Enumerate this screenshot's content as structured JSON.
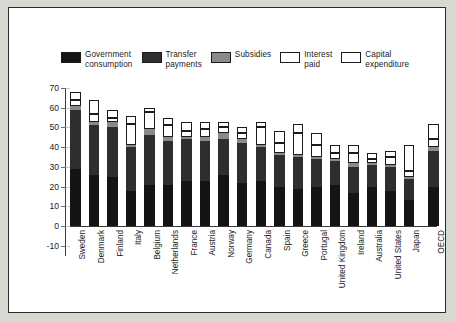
{
  "chart_data": {
    "type": "bar",
    "stacked": true,
    "title": "",
    "xlabel": "",
    "ylabel": "",
    "ylim": [
      -10,
      70
    ],
    "yticks": [
      -10,
      0,
      10,
      20,
      30,
      40,
      50,
      60,
      70
    ],
    "grid": false,
    "legend_position": "top",
    "categories": [
      "Sweden",
      "Denmark",
      "Finland",
      "Italy",
      "Belgium",
      "Netherlands",
      "France",
      "Austria",
      "Norway",
      "Germany",
      "Canada",
      "Spain",
      "Greece",
      "Portugal",
      "United Kingdom",
      "Ireland",
      "Australia",
      "United States",
      "Japan",
      "OECD"
    ],
    "series": [
      {
        "name": "Government consumption",
        "color": "#141414",
        "values": [
          29,
          26,
          25,
          18,
          21,
          21,
          23,
          23,
          26,
          22,
          23,
          20,
          19,
          20,
          21,
          17,
          20,
          18,
          13,
          20
        ]
      },
      {
        "name": "Transfer payments",
        "color": "#2e2e2e",
        "values": [
          30,
          25,
          25,
          22,
          25,
          22,
          21,
          20,
          18,
          20,
          17,
          16,
          16,
          14,
          12,
          13,
          11,
          12,
          11,
          18
        ]
      },
      {
        "name": "Subsidies",
        "color": "#8a8a8a",
        "values": [
          2,
          2,
          3,
          1,
          3,
          2,
          1,
          2,
          3,
          2,
          1,
          1,
          1,
          1,
          1,
          2,
          1,
          1,
          1,
          2
        ]
      },
      {
        "name": "Interest paid",
        "color": "#ffffff",
        "values": [
          3,
          4,
          2,
          11,
          9,
          6,
          3,
          4,
          3,
          3,
          9,
          5,
          11,
          6,
          3,
          5,
          2,
          4,
          3,
          4
        ]
      },
      {
        "name": "Capital expenditure",
        "color": "#ffffff",
        "values": [
          4,
          7,
          4,
          4,
          2,
          4,
          5,
          4,
          3,
          3,
          3,
          6,
          5,
          6,
          4,
          4,
          3,
          3,
          13,
          8
        ]
      }
    ],
    "totals": [
      68,
      64,
      59,
      56,
      60,
      55,
      53,
      53,
      53,
      50,
      53,
      48,
      52,
      47,
      41,
      41,
      37,
      38,
      41,
      52
    ]
  },
  "legend": {
    "items": [
      {
        "label": "Government\nconsumption",
        "swatch": "dark-solid",
        "color": "#141414"
      },
      {
        "label": "Transfer\npayments",
        "swatch": "dark-solid",
        "color": "#2e2e2e"
      },
      {
        "label": "Subsidies",
        "swatch": "gray-solid",
        "color": "#8a8a8a"
      },
      {
        "label": "Interest\npaid",
        "swatch": "white-outline",
        "color": "#ffffff"
      },
      {
        "label": "Capital\nexpenditure",
        "swatch": "white-outline",
        "color": "#ffffff"
      }
    ]
  },
  "axes": {
    "ytick_labels": [
      "70",
      "60",
      "50",
      "40",
      "30",
      "20",
      "10",
      "0",
      "-10"
    ]
  }
}
